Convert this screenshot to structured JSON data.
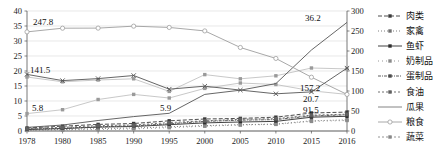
{
  "chart_data": {
    "type": "line",
    "title": "",
    "xlabel": "",
    "ylabel": "",
    "categories": [
      "1978",
      "1980",
      "1985",
      "1990",
      "1995",
      "2000",
      "2005",
      "2010",
      "2015",
      "2016"
    ],
    "left_axis": {
      "label": "",
      "min": 0,
      "max": 40,
      "step": 5,
      "ticks": [
        "0",
        "5",
        "10",
        "15",
        "20",
        "25",
        "30",
        "35",
        "40"
      ]
    },
    "right_axis": {
      "label": "",
      "min": 0,
      "max": 300,
      "step": 50,
      "ticks": [
        "0",
        "50",
        "100",
        "150",
        "200",
        "250",
        "300"
      ]
    },
    "grid": true,
    "legend_position": "right",
    "annotations": [
      {
        "text": "247.8",
        "x": "1978",
        "series": "粮食"
      },
      {
        "text": "141.5",
        "x": "1978",
        "series": "蔬菜"
      },
      {
        "text": "5.8",
        "x": "1978",
        "series": "瓜果"
      },
      {
        "text": "5.9",
        "x": "1995",
        "series": "瓜果"
      },
      {
        "text": "36.2",
        "x": "2016",
        "series": "瓜果"
      },
      {
        "text": "157.2",
        "x": "2016",
        "series": "蔬菜"
      },
      {
        "text": "20.7",
        "x": "2016",
        "series": "肉类"
      },
      {
        "text": "91.5",
        "x": "2016",
        "series": "粮食"
      }
    ],
    "series": [
      {
        "name": "肉类",
        "axis": "left",
        "marker": "square",
        "dash": "4 2",
        "values": [
          1.0,
          1.6,
          2.2,
          2.5,
          3.4,
          4.0,
          4.2,
          4.6,
          6.0,
          6.3
        ]
      },
      {
        "name": "家禽",
        "axis": "left",
        "marker": "square",
        "dash": "1 2",
        "values": [
          0.3,
          0.5,
          0.8,
          1.0,
          1.4,
          1.8,
          2.1,
          2.3,
          3.4,
          3.7
        ]
      },
      {
        "name": "鱼虾",
        "axis": "left",
        "marker": "square",
        "dash": "none",
        "values": [
          0.5,
          0.8,
          1.3,
          1.5,
          2.1,
          2.7,
          3.0,
          3.2,
          4.6,
          4.9
        ]
      },
      {
        "name": "奶制品",
        "axis": "left",
        "marker": "square",
        "dash": "1 3",
        "values": [
          0.2,
          0.3,
          0.5,
          0.7,
          1.1,
          1.6,
          2.0,
          2.2,
          3.2,
          3.5
        ]
      },
      {
        "name": "蛋制品",
        "axis": "left",
        "marker": "square",
        "dash": "3 1 1 1",
        "values": [
          0.6,
          0.9,
          1.4,
          1.7,
          2.4,
          3.2,
          3.6,
          3.8,
          5.0,
          5.4
        ]
      },
      {
        "name": "食油",
        "axis": "left",
        "marker": "square",
        "dash": "2 2",
        "values": [
          0.8,
          1.2,
          1.8,
          2.0,
          2.8,
          3.4,
          3.9,
          4.1,
          5.3,
          5.6
        ]
      },
      {
        "name": "瓜果",
        "axis": "left",
        "marker": "none",
        "dash": "none",
        "values": [
          1.2,
          2.0,
          3.5,
          4.8,
          5.9,
          12.2,
          13.6,
          15.8,
          27.0,
          36.2
        ]
      },
      {
        "name": "粮食",
        "axis": "right",
        "marker": "circle-open",
        "dash": "none",
        "values": [
          247.8,
          257.0,
          257.2,
          262.1,
          258.9,
          250.2,
          208.8,
          181.4,
          134.5,
          91.5
        ]
      },
      {
        "name": "蔬菜",
        "axis": "right",
        "marker": "x",
        "dash": "none",
        "values": [
          141.5,
          126.0,
          131.0,
          138.7,
          104.6,
          112.0,
          102.3,
          93.0,
          97.8,
          157.2
        ]
      }
    ],
    "series_b": [
      {
        "name": "series-mid-a",
        "axis": "left",
        "values": [
          18.0,
          16.4,
          17.0,
          17.4,
          13.2,
          18.8,
          17.4,
          18.4,
          21.0,
          20.7
        ]
      },
      {
        "name": "series-mid-b",
        "axis": "left",
        "values": [
          5.8,
          7.1,
          10.5,
          12.2,
          11.0,
          14.2,
          16.0,
          15.5,
          13.4,
          12.2
        ]
      }
    ]
  },
  "legend": {
    "items": [
      {
        "label": "肉类",
        "key": "dash-square"
      },
      {
        "label": "家禽",
        "key": "dot-square"
      },
      {
        "label": "鱼虾",
        "key": "solid-square"
      },
      {
        "label": "奶制品",
        "key": "fine-dot-square"
      },
      {
        "label": "蛋制品",
        "key": "dashdot-square"
      },
      {
        "label": "食油",
        "key": "dashed-square"
      },
      {
        "label": "瓜果",
        "key": "solid-plain"
      },
      {
        "label": "粮食",
        "key": "circle-open"
      },
      {
        "label": "蔬菜",
        "key": "x-mark"
      }
    ]
  }
}
